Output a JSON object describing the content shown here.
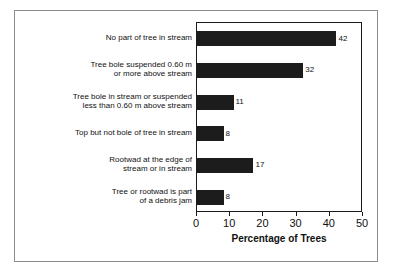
{
  "chart_data": {
    "type": "bar",
    "orientation": "horizontal",
    "title": "",
    "xlabel": "Percentage of Trees",
    "ylabel": "",
    "xlim": [
      0,
      50
    ],
    "xticks": [
      0,
      10,
      20,
      30,
      40,
      50
    ],
    "grid": false,
    "legend": false,
    "bar_color": "#1c1c1c",
    "categories": [
      "No part of tree in stream",
      "Tree bole suspended 0.60 m or more above stream",
      "Tree bole in stream or suspended less than 0.60 m above stream",
      "Top but not bole of tree in stream",
      "Rootwad at the edge of stream or in stream",
      "Tree or rootwad is part of a debris jam"
    ],
    "category_lines": [
      [
        "No part of tree in stream"
      ],
      [
        "Tree bole suspended 0.60 m",
        "or more above stream"
      ],
      [
        "Tree bole in stream or suspended",
        "less than 0.60 m above stream"
      ],
      [
        "Top but not bole of tree in stream"
      ],
      [
        "Rootwad at the edge of",
        "stream or in stream"
      ],
      [
        "Tree or rootwad is part",
        "of a debris jam"
      ]
    ],
    "values": [
      42,
      32,
      11,
      8,
      17,
      8
    ],
    "value_labels": [
      "42",
      "32",
      "11",
      "8",
      "17",
      "8"
    ]
  }
}
